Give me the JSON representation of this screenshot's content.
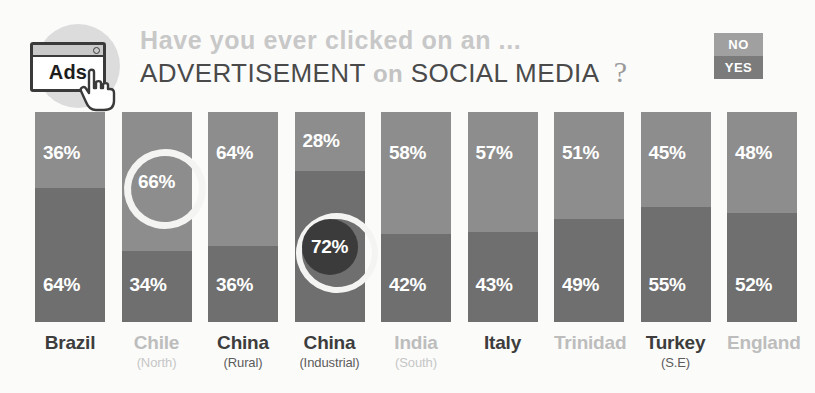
{
  "header": {
    "icon_label": "Ads",
    "icon_name": "ads-browser-window-icon",
    "line1": "Have you ever clicked on an ...",
    "line2_part1": "ADVERTISEMENT",
    "line2_connector": "on",
    "line2_part2": "SOCIAL MEDIA",
    "question_mark": "?"
  },
  "legend": {
    "no_label": "NO",
    "yes_label": "YES",
    "no_color": "#a0a0a0",
    "yes_color": "#7b7b7b"
  },
  "colors": {
    "no_segment": "#8d8d8d",
    "yes_segment": "#6f6f6f",
    "highlight_fill": "#3b3b3b",
    "highlight_ring": "#f4f4f2",
    "background": "#fbfbfa",
    "label_dark": "#3d3d3d",
    "label_light": "#bdbdbd"
  },
  "chart_data": {
    "type": "bar",
    "title": "Have you ever clicked on an ... ADVERTISEMENT on SOCIAL MEDIA ?",
    "xlabel": "",
    "ylabel": "",
    "ylim": [
      0,
      100
    ],
    "grid": false,
    "legend_position": "top-right",
    "stacked": true,
    "categories": [
      "Brazil",
      "Chile (North)",
      "China (Rural)",
      "China (Industrial)",
      "India (South)",
      "Italy",
      "Trinidad",
      "Turkey (S.E)",
      "England"
    ],
    "series": [
      {
        "name": "NO",
        "values": [
          36,
          66,
          64,
          28,
          58,
          57,
          51,
          45,
          48
        ]
      },
      {
        "name": "YES",
        "values": [
          64,
          34,
          36,
          72,
          42,
          43,
          49,
          55,
          52
        ]
      }
    ],
    "annotations": [
      {
        "category": "Chile (North)",
        "series": "NO",
        "value": 66,
        "style": "open-ring-highlight"
      },
      {
        "category": "China (Industrial)",
        "series": "YES",
        "value": 72,
        "style": "filled-circle-highlight"
      }
    ]
  },
  "bars": [
    {
      "country": "Brazil",
      "sub": "",
      "tone": "dark",
      "no": "36%",
      "yes": "64%",
      "no_value": 36,
      "yes_value": 64,
      "highlight": "none"
    },
    {
      "country": "Chile",
      "sub": "(North)",
      "tone": "light",
      "no": "66%",
      "yes": "34%",
      "no_value": 66,
      "yes_value": 34,
      "highlight": "no-open"
    },
    {
      "country": "China",
      "sub": "(Rural)",
      "tone": "dark",
      "no": "64%",
      "yes": "36%",
      "no_value": 64,
      "yes_value": 36,
      "highlight": "none"
    },
    {
      "country": "China",
      "sub": "(Industrial)",
      "tone": "dark",
      "no": "28%",
      "yes": "72%",
      "no_value": 28,
      "yes_value": 72,
      "highlight": "yes-filled"
    },
    {
      "country": "India",
      "sub": "(South)",
      "tone": "light",
      "no": "58%",
      "yes": "42%",
      "no_value": 58,
      "yes_value": 42,
      "highlight": "none"
    },
    {
      "country": "Italy",
      "sub": "",
      "tone": "dark",
      "no": "57%",
      "yes": "43%",
      "no_value": 57,
      "yes_value": 43,
      "highlight": "none"
    },
    {
      "country": "Trinidad",
      "sub": "",
      "tone": "light",
      "no": "51%",
      "yes": "49%",
      "no_value": 51,
      "yes_value": 49,
      "highlight": "none"
    },
    {
      "country": "Turkey",
      "sub": "(S.E)",
      "tone": "dark",
      "no": "45%",
      "yes": "55%",
      "no_value": 45,
      "yes_value": 55,
      "highlight": "none"
    },
    {
      "country": "England",
      "sub": "",
      "tone": "light",
      "no": "48%",
      "yes": "52%",
      "no_value": 48,
      "yes_value": 52,
      "highlight": "none"
    }
  ]
}
